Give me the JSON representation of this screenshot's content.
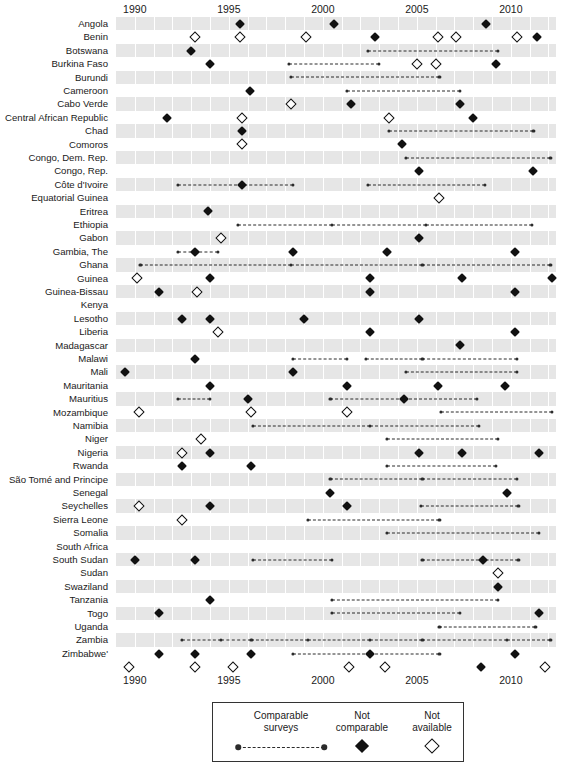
{
  "chart_data": {
    "type": "table",
    "title": "",
    "subtitle": "",
    "xlabel": "",
    "ylabel": "",
    "xlim": [
      1989,
      2012.4
    ],
    "grid": true,
    "legend_position": "bottom-center",
    "x_ticks": [
      1990,
      1995,
      2000,
      2005,
      2010
    ],
    "x_tick_labels": [
      "1990",
      "1995",
      "2000",
      "2005",
      "2010"
    ],
    "marker_types": {
      "comparable": "Comparable surveys",
      "not_comparable": "Not comparable",
      "not_available": "Not available"
    },
    "categories": [
      "Angola",
      "Benin",
      "Botswana",
      "Burkina Faso",
      "Burundi",
      "Cameroon",
      "Cabo Verde",
      "Central African Republic",
      "Chad",
      "Comoros",
      "Congo, Dem. Rep.",
      "Congo, Rep.",
      "Côte d'Ivoire",
      "Equatorial Guinea",
      "Eritrea",
      "Ethiopia",
      "Gabon",
      "Gambia, The",
      "Ghana",
      "Guinea",
      "Guinea-Bissau",
      "Kenya",
      "Lesotho",
      "Liberia",
      "Madagascar",
      "Malawi",
      "Mali",
      "Mauritania",
      "Mauritius",
      "Mozambique",
      "Namibia",
      "Niger",
      "Nigeria",
      "Rwanda",
      "São Tomé and Principe",
      "Senegal",
      "Seychelles",
      "Sierra Leone",
      "Somalia",
      "South Africa",
      "South Sudan",
      "Sudan",
      "Swaziland",
      "Tanzania",
      "Togo",
      "Uganda",
      "Zambia",
      "Zimbabwe'"
    ],
    "rows": [
      {
        "country": "Angola",
        "filled": [
          1995.6,
          2000.6,
          2008.7
        ],
        "open": [],
        "segments": []
      },
      {
        "country": "Benin",
        "filled": [
          2002.8,
          2011.4
        ],
        "open": [
          1993.2,
          1995.6,
          1999.1,
          2006.1,
          2007.1,
          2010.3
        ],
        "segments": []
      },
      {
        "country": "Botswana",
        "filled": [
          1993.0
        ],
        "open": [],
        "segments": [
          [
            2002.4,
            2009.3
          ]
        ]
      },
      {
        "country": "Burkina Faso",
        "filled": [
          1994.0,
          2009.2
        ],
        "open": [
          2005.0,
          2006.0
        ],
        "segments": [
          [
            1998.2,
            2003.0
          ]
        ]
      },
      {
        "country": "Burundi",
        "filled": [],
        "open": [],
        "segments": [
          [
            1998.3,
            2006.2
          ]
        ]
      },
      {
        "country": "Cameroon",
        "filled": [
          1996.1
        ],
        "open": [],
        "segments": [
          [
            2001.3,
            2007.3
          ]
        ]
      },
      {
        "country": "Cabo Verde",
        "filled": [
          2001.5,
          2007.3
        ],
        "open": [
          1998.3
        ],
        "segments": []
      },
      {
        "country": "Central African Republic",
        "filled": [
          1991.7,
          2008.0
        ],
        "open": [
          1995.7,
          2003.5
        ],
        "segments": []
      },
      {
        "country": "Chad",
        "filled": [
          1995.7
        ],
        "open": [],
        "segments": [
          [
            2003.5,
            2011.2
          ]
        ]
      },
      {
        "country": "Comoros",
        "filled": [
          2004.2
        ],
        "open": [
          1995.7
        ],
        "segments": []
      },
      {
        "country": "Congo, Dem. Rep.",
        "filled": [],
        "open": [],
        "segments": [
          [
            2004.4,
            2012.1
          ]
        ]
      },
      {
        "country": "Congo, Rep.",
        "filled": [
          2005.1,
          2011.2
        ],
        "open": [],
        "segments": []
      },
      {
        "country": "Côte d'Ivoire",
        "filled": [
          1995.7
        ],
        "open": [],
        "segments": [
          [
            1992.3,
            1998.4
          ],
          [
            2002.4,
            2008.6
          ]
        ]
      },
      {
        "country": "Equatorial Guinea",
        "filled": [],
        "open": [
          2006.2
        ],
        "segments": []
      },
      {
        "country": "Eritrea",
        "filled": [
          1993.9
        ],
        "open": [],
        "segments": []
      },
      {
        "country": "Ethiopia",
        "filled": [],
        "open": [],
        "segments": [
          [
            1995.5,
            2000.5,
            2005.5,
            2011.1
          ]
        ]
      },
      {
        "country": "Gabon",
        "filled": [
          2005.1
        ],
        "open": [
          1994.6
        ],
        "segments": []
      },
      {
        "country": "Gambia, The",
        "filled": [
          1993.2,
          1998.4,
          2003.4,
          2010.2
        ],
        "open": [],
        "segments": [
          [
            1992.3,
            1994.4
          ]
        ]
      },
      {
        "country": "Ghana",
        "filled": [],
        "open": [],
        "segments": [
          [
            1990.3,
            1998.3,
            2005.3,
            2012.1
          ]
        ]
      },
      {
        "country": "Guinea",
        "filled": [
          1994.0,
          2002.5,
          2007.4,
          2012.2
        ],
        "open": [
          1990.1
        ],
        "segments": []
      },
      {
        "country": "Guinea-Bissau",
        "filled": [
          1991.3,
          2002.5,
          2010.2
        ],
        "open": [
          1993.3
        ],
        "segments": []
      },
      {
        "country": "Guinea-Bissau-dup",
        "filled": [],
        "open": [],
        "segments": []
      },
      {
        "country": "Kenya",
        "filled": [
          1992.5,
          1994.0,
          1999.0,
          2005.1
        ],
        "open": [],
        "segments": []
      },
      {
        "country": "Lesotho",
        "filled": [
          2002.5,
          2010.2
        ],
        "open": [
          1994.4
        ],
        "segments": []
      },
      {
        "country": "Liberia",
        "filled": [
          2007.3
        ],
        "open": [],
        "segments": []
      },
      {
        "country": "Madagascar",
        "filled": [
          1993.2
        ],
        "open": [],
        "segments": [
          [
            1998.4,
            2001.3
          ],
          [
            2002.3,
            2005.3,
            2010.3
          ]
        ]
      },
      {
        "country": "Malawi",
        "filled": [
          1989.5,
          1998.4
        ],
        "open": [],
        "segments": [
          [
            2004.4,
            2010.3
          ]
        ]
      },
      {
        "country": "Mali",
        "filled": [
          1994.0,
          2001.3,
          2006.1,
          2009.7
        ],
        "open": [],
        "segments": []
      },
      {
        "country": "Mauritania",
        "filled": [
          1996.0,
          2004.3
        ],
        "open": [],
        "segments": [
          [
            1992.3,
            1994.0
          ],
          [
            2000.4,
            2004.3,
            2008.2
          ]
        ]
      },
      {
        "country": "Mauritius",
        "filled": [],
        "open": [
          1990.2,
          1996.2,
          2001.3
        ],
        "segments": [
          [
            2006.3,
            2012.2
          ]
        ]
      },
      {
        "country": "Mozambique",
        "filled": [],
        "open": [],
        "segments": [
          [
            1996.3,
            2002.5,
            2008.3
          ]
        ]
      },
      {
        "country": "Namibia",
        "filled": [],
        "open": [
          1993.5
        ],
        "segments": [
          [
            2003.4,
            2009.3
          ]
        ]
      },
      {
        "country": "Niger",
        "filled": [
          1994.0,
          2005.1,
          2007.4,
          2011.5
        ],
        "open": [
          1992.5
        ],
        "segments": []
      },
      {
        "country": "Nigeria",
        "filled": [
          1992.5,
          1996.2
        ],
        "open": [],
        "segments": [
          [
            2003.4,
            2009.2
          ]
        ]
      },
      {
        "country": "Rwanda",
        "filled": [],
        "open": [],
        "segments": [
          [
            2000.4,
            2005.3,
            2010.3
          ]
        ]
      },
      {
        "country": "São Tomé and Principe",
        "filled": [
          2000.4,
          2009.8
        ],
        "open": [],
        "segments": []
      },
      {
        "country": "Senegal",
        "filled": [
          1994.0,
          2001.3
        ],
        "open": [
          1990.2
        ],
        "segments": [
          [
            2005.2,
            2010.4
          ]
        ]
      },
      {
        "country": "Seychelles",
        "filled": [],
        "open": [
          1992.5
        ],
        "segments": [
          [
            1999.2,
            2006.2
          ]
        ]
      },
      {
        "country": "Sierra Leone",
        "filled": [],
        "open": [],
        "segments": [
          [
            2003.4,
            2011.5
          ]
        ]
      },
      {
        "country": "Somalia",
        "filled": [],
        "open": [],
        "segments": []
      },
      {
        "country": "South Africa",
        "filled": [
          1990.0,
          1993.2,
          2008.5
        ],
        "open": [],
        "segments": [
          [
            1996.3,
            2000.5
          ],
          [
            2005.3,
            2010.4
          ]
        ]
      },
      {
        "country": "South Sudan",
        "filled": [],
        "open": [
          2009.3
        ],
        "segments": []
      },
      {
        "country": "Sudan",
        "filled": [
          2009.3
        ],
        "open": [],
        "segments": []
      },
      {
        "country": "Swaziland",
        "filled": [
          1994.0
        ],
        "open": [],
        "segments": [
          [
            2000.5,
            2009.3
          ]
        ]
      },
      {
        "country": "Tanzania",
        "filled": [
          1991.3,
          2011.5
        ],
        "open": [],
        "segments": [
          [
            2000.5,
            2007.3
          ]
        ]
      },
      {
        "country": "Togo",
        "filled": [],
        "open": [],
        "segments": [
          [
            2006.2,
            2011.3
          ]
        ]
      },
      {
        "country": "Uganda",
        "filled": [],
        "open": [],
        "segments": [
          [
            1992.5,
            1994.6,
            1996.2,
            1999.2,
            2002.5,
            2005.3,
            2009.8,
            2012.1
          ]
        ]
      },
      {
        "country": "Zambia",
        "filled": [
          1991.3,
          1993.2,
          1996.2,
          2002.5,
          2010.2
        ],
        "open": [],
        "segments": [
          [
            1998.4,
            2002.5,
            2006.2
          ]
        ]
      },
      {
        "country": "Zimbabwe'",
        "filled": [
          2008.4
        ],
        "open": [
          1989.7,
          1993.2,
          1995.2,
          2001.4,
          2003.3,
          2011.8
        ],
        "segments": []
      }
    ]
  },
  "legend": {
    "items": [
      {
        "label_line1": "Comparable",
        "label_line2": "surveys",
        "symbol": "comparable-symbol"
      },
      {
        "label_line1": "Not",
        "label_line2": "comparable",
        "symbol": "filled-diamond-symbol"
      },
      {
        "label_line1": "Not",
        "label_line2": "available",
        "symbol": "open-diamond-symbol"
      }
    ]
  },
  "colors": {
    "band": "#e6e6e6",
    "marker": "#111111",
    "dash": "#2b2b2b",
    "text": "#1a1a1a",
    "background": "#ffffff"
  }
}
